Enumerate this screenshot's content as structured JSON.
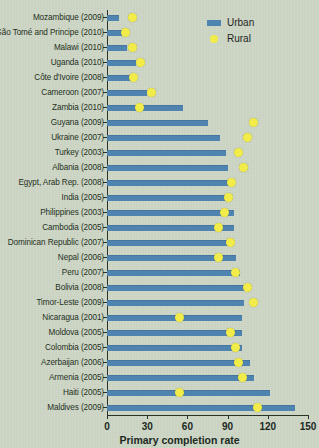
{
  "chart": {
    "title": "",
    "x_axis_title": "Primary completion rate",
    "legend": [
      {
        "key": "urban",
        "label": "Urban",
        "color": "#4f83b0",
        "marker": "bar"
      },
      {
        "key": "rural",
        "label": "Rural",
        "color": "#f2ec4a",
        "marker": "dot"
      }
    ],
    "x_ticks": [
      "0",
      "30",
      "60",
      "90",
      "120",
      "150"
    ]
  },
  "chart_data": {
    "type": "bar",
    "title": "",
    "xlabel": "Primary completion rate",
    "ylabel": "",
    "xlim": [
      0,
      150
    ],
    "grid": false,
    "legend_position": "top-right",
    "orientation": "horizontal",
    "categories": [
      "Mozambique (2009)",
      "São Tomé and Principe (2010)",
      "Malawi  (2010)",
      "Uganda (2010)",
      "Côte d'Ivoire (2008)",
      "Cameroon (2007)",
      "Zambia (2010)",
      "Guyana (2009)",
      "Ukraine (2007)",
      "Turkey (2003)",
      "Albania (2008)",
      "Egypt, Arab Rep. (2008)",
      "India (2005)",
      "Philippines (2003)",
      "Cambodia (2005)",
      "Dominican Republic (2007)",
      "Nepal (2006)",
      "Peru (2007)",
      "Bolivia (2008)",
      "Timor-Leste (2009)",
      "Nicaragua (2001)",
      "Moldova (2005)",
      "Colombia (2005)",
      "Azerbaijan (2006)",
      "Armenia (2005)",
      "Haiti (2005)",
      "Maldives (2009)"
    ],
    "series": [
      {
        "name": "Urban",
        "type": "bar",
        "color": "#4f83b0",
        "values": [
          9,
          11,
          15,
          22,
          19,
          30,
          57,
          75,
          84,
          89,
          90,
          94,
          92,
          95,
          95,
          95,
          96,
          99,
          104,
          102,
          101,
          101,
          101,
          107,
          110,
          122,
          140
        ]
      },
      {
        "name": "Rural",
        "type": "scatter",
        "color": "#f2ec4a",
        "values": [
          19,
          14,
          19,
          25,
          20,
          33,
          24,
          109,
          105,
          98,
          102,
          93,
          91,
          88,
          83,
          92,
          83,
          96,
          105,
          109,
          54,
          92,
          96,
          98,
          101,
          54,
          112
        ]
      }
    ]
  }
}
